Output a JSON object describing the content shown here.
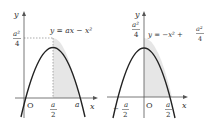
{
  "graphs": [
    {
      "id": "left",
      "equation": "y = ax − x²",
      "axis_x_label": "x",
      "axis_y_label": "y",
      "origin_label": "O",
      "y_tick_label": {
        "num": "a²",
        "den": "4"
      },
      "x_tick_labels": [
        {
          "type": "fraction",
          "num": "a",
          "den": "2"
        },
        {
          "type": "plain",
          "text": "a"
        }
      ],
      "shaded_region": "from x = a/2 to x = a under curve"
    },
    {
      "id": "right",
      "equation_prefix": "y = −x² +",
      "equation_fraction": {
        "num": "a²",
        "den": "4"
      },
      "axis_x_label": "x",
      "axis_y_label": "y",
      "origin_label": "O",
      "y_tick_label": {
        "num": "a²",
        "den": "4"
      },
      "x_tick_labels": [
        {
          "type": "fraction",
          "sign": "−",
          "num": "a",
          "den": "2"
        },
        {
          "type": "fraction",
          "num": "a",
          "den": "2"
        }
      ],
      "shaded_region": "from x = 0 to x = a/2 under curve"
    }
  ],
  "colors": {
    "curve": "#222222",
    "axis": "#555555",
    "shade": "#e6e6e6",
    "dotted": "#888888"
  }
}
